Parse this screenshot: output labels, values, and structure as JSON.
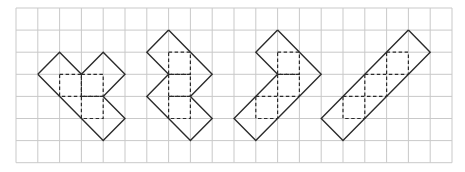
{
  "grid": {
    "origin_x": 16,
    "origin_y": 8,
    "cell_w": 21.8,
    "cell_h": 22.1,
    "cols": 20,
    "rows": 7,
    "line_color": "#c9c9c9"
  },
  "figures": [
    {
      "name": "figure-1",
      "outline": [
        [
          1,
          3
        ],
        [
          2,
          2
        ],
        [
          3,
          3
        ],
        [
          4,
          2
        ],
        [
          5,
          3
        ],
        [
          4,
          4
        ],
        [
          5,
          5
        ],
        [
          4,
          6
        ],
        [
          1,
          3
        ]
      ],
      "dashed_squares": [
        [
          2,
          3
        ],
        [
          3,
          3
        ],
        [
          3,
          4
        ]
      ]
    },
    {
      "name": "figure-2",
      "outline": [
        [
          7,
          1
        ],
        [
          9,
          3
        ],
        [
          8,
          4
        ],
        [
          9,
          5
        ],
        [
          8,
          6
        ],
        [
          6,
          4
        ],
        [
          7,
          3
        ],
        [
          6,
          2
        ],
        [
          7,
          1
        ]
      ],
      "dashed_squares": [
        [
          7,
          2
        ],
        [
          7,
          3
        ],
        [
          7,
          4
        ]
      ]
    },
    {
      "name": "figure-3",
      "outline": [
        [
          12,
          1
        ],
        [
          14,
          3
        ],
        [
          11,
          6
        ],
        [
          10,
          5
        ],
        [
          12,
          3
        ],
        [
          11,
          2
        ],
        [
          12,
          1
        ]
      ],
      "dashed_squares": [
        [
          12,
          2
        ],
        [
          12,
          3
        ],
        [
          11,
          4
        ]
      ]
    },
    {
      "name": "figure-4",
      "outline": [
        [
          18,
          1
        ],
        [
          19,
          2
        ],
        [
          15,
          6
        ],
        [
          14,
          5
        ],
        [
          18,
          1
        ]
      ],
      "dashed_squares": [
        [
          17,
          2
        ],
        [
          16,
          3
        ],
        [
          15,
          4
        ]
      ]
    }
  ],
  "colors": {
    "figure_stroke": "#2b2b2b",
    "background": "#ffffff"
  }
}
